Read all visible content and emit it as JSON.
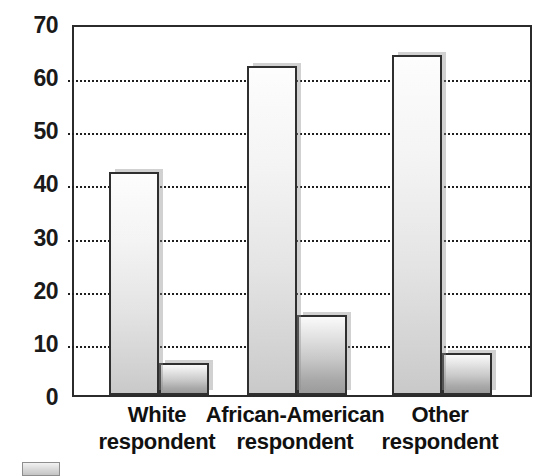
{
  "chart_data": {
    "type": "bar",
    "title": "",
    "subtitle": "",
    "xlabel": "",
    "ylabel": "",
    "categories": [
      "White\nrespondent",
      "African-American\nrespondent",
      "Other\nrespondent"
    ],
    "category_lines": [
      [
        "White",
        "respondent"
      ],
      [
        "African-American",
        "respondent"
      ],
      [
        "Other",
        "respondent"
      ]
    ],
    "series": [
      {
        "name": "series-1",
        "values": [
          42,
          62,
          64
        ]
      },
      {
        "name": "series-2",
        "values": [
          6,
          15,
          8
        ]
      }
    ],
    "ylim": [
      0,
      70
    ],
    "yticks": [
      0,
      10,
      20,
      30,
      40,
      50,
      60,
      70
    ],
    "ytick_labels": [
      "0",
      "10",
      "20",
      "30",
      "40",
      "50",
      "60",
      "70"
    ],
    "gridlines_at": [
      10,
      20,
      30,
      40,
      50,
      60
    ],
    "grid": true,
    "legend": "",
    "legend_position": "bottom-left",
    "annotations": [],
    "colors": {
      "series_1_fill_top": "#fdfdfd",
      "series_1_fill_bottom": "#c9c9c9",
      "series_2_fill_top": "#fafafa",
      "series_2_fill_bottom": "#9b9b9b",
      "bar_outline": "#2f2f2f",
      "gridline": "#1f1f1f",
      "axis": "#2b2b2b",
      "text": "#111111",
      "background": "#ffffff"
    }
  }
}
